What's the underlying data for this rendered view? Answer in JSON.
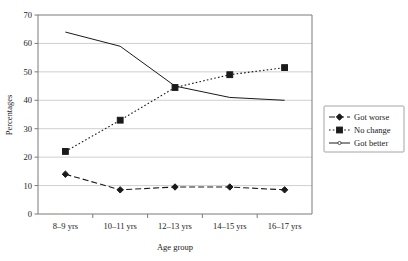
{
  "chart_data": {
    "type": "line",
    "title": "",
    "subtitle": "",
    "xlabel": "Age group",
    "ylabel": "Percentages",
    "categories": [
      "8–9 yrs",
      "10–11 yrs",
      "12–13 yrs",
      "14–15 yrs",
      "16–17 yrs"
    ],
    "ylim": [
      0,
      70
    ],
    "yticks": [
      0,
      10,
      20,
      30,
      40,
      50,
      60,
      70
    ],
    "ytick_labels": [
      "0",
      "10",
      "20",
      "30",
      "40",
      "50",
      "60",
      "70"
    ],
    "grid": true,
    "grid_axis": "y",
    "legend_position": "right",
    "series": [
      {
        "name": "Got worse",
        "values": [
          14,
          8.5,
          9.5,
          9.5,
          8.5
        ],
        "line_style": "dashed",
        "marker": "diamond",
        "color": "#1a1a1a"
      },
      {
        "name": "No change",
        "values": [
          22,
          33,
          44.5,
          49,
          51.5
        ],
        "line_style": "dotted",
        "marker": "square",
        "color": "#1a1a1a"
      },
      {
        "name": "Got better",
        "values": [
          64,
          59,
          45,
          41,
          40
        ],
        "line_style": "solid",
        "marker": "none",
        "color": "#1a1a1a"
      }
    ]
  },
  "legend": {
    "entries": [
      {
        "label": "Got worse"
      },
      {
        "label": "No change"
      },
      {
        "label": "Got better"
      }
    ]
  },
  "axes": {
    "x_title": "Age group",
    "y_title": "Percentages"
  }
}
